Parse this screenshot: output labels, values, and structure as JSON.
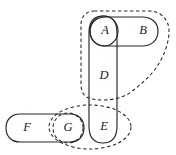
{
  "diagram": {
    "type": "set-membership-diagram",
    "title": "",
    "canvas": {
      "width": 176,
      "height": 155,
      "background": "#ffffff"
    },
    "colors": {
      "stroke": "#262626",
      "label": "#1a1a1a",
      "background": "#ffffff"
    },
    "nodes": [
      {
        "id": "A",
        "label": "A",
        "x": 105,
        "y": 31,
        "shape": "circle"
      },
      {
        "id": "B",
        "label": "B",
        "x": 143,
        "y": 31,
        "shape": "none"
      },
      {
        "id": "D",
        "label": "D",
        "x": 104,
        "y": 76,
        "shape": "none"
      },
      {
        "id": "E",
        "label": "E",
        "x": 104,
        "y": 127,
        "shape": "none"
      },
      {
        "id": "F",
        "label": "F",
        "x": 27,
        "y": 128,
        "shape": "none"
      },
      {
        "id": "G",
        "label": "G",
        "x": 68,
        "y": 128,
        "shape": "circle"
      }
    ],
    "regions": [
      {
        "id": "region-ab",
        "style": "solid",
        "shape": "horizontal-stadium",
        "contains": [
          "A",
          "B"
        ]
      },
      {
        "id": "region-ade",
        "style": "solid",
        "shape": "vertical-stadium",
        "contains": [
          "A",
          "D",
          "E"
        ]
      },
      {
        "id": "region-a",
        "style": "solid",
        "shape": "circle",
        "contains": [
          "A"
        ]
      },
      {
        "id": "region-fg",
        "style": "solid",
        "shape": "horizontal-stadium",
        "contains": [
          "F",
          "G"
        ]
      },
      {
        "id": "region-g",
        "style": "dashed",
        "shape": "circle",
        "contains": [
          "G"
        ]
      },
      {
        "id": "region-abd",
        "style": "dashed",
        "shape": "teardrop",
        "contains": [
          "A",
          "B",
          "D"
        ]
      },
      {
        "id": "region-ge",
        "style": "dashed",
        "shape": "ellipse",
        "contains": [
          "G",
          "E"
        ]
      }
    ]
  }
}
